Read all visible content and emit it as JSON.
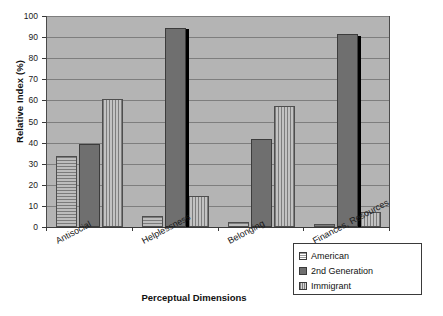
{
  "chart_data": {
    "type": "bar",
    "title": "",
    "xlabel": "Perceptual Dimensions",
    "ylabel": "Relative Index (%)",
    "categories": [
      "Antisocial",
      "Helplessness",
      "Belonging",
      "Finances, Resources"
    ],
    "series": [
      {
        "name": "American",
        "values": [
          33.5,
          5.0,
          2.5,
          1.2
        ]
      },
      {
        "name": "2nd Generation",
        "values": [
          39.5,
          94.5,
          41.5,
          91.5
        ]
      },
      {
        "name": "Immigrant",
        "values": [
          60.5,
          14.5,
          57.5,
          7.3
        ]
      }
    ],
    "ylim": [
      0,
      100
    ],
    "ytick_labels": [
      "100",
      "90",
      "80",
      "70",
      "60",
      "50",
      "40",
      "30",
      "20",
      "10",
      "0"
    ],
    "ytick_values": [
      100,
      90,
      80,
      70,
      60,
      50,
      40,
      30,
      20,
      10,
      0
    ],
    "grid": true,
    "legend_position": "bottom-right",
    "annotations": [
      {
        "name": "helplessness-marker",
        "category": "Helplessness",
        "top_value": 94.0,
        "bottom_value": 0
      },
      {
        "name": "finances-marker",
        "category": "Finances, Resources",
        "top_value": 90.5,
        "bottom_value": 0
      }
    ],
    "colors": {
      "plot_background": "#b4b4b4",
      "gridline": "#7e7e7e",
      "american": "#b9b9b9",
      "second_generation": "#6f6f6f",
      "immigrant": "#bcbcbc",
      "annotation_line": "#000000",
      "axis": "#3a3a3a",
      "text": "#1a1a1a"
    }
  },
  "legend": {
    "items": [
      {
        "label": "American",
        "swatch": "american-swatch-icon"
      },
      {
        "label": "2nd Generation",
        "swatch": "second-generation-swatch-icon"
      },
      {
        "label": "Immigrant",
        "swatch": "immigrant-swatch-icon"
      }
    ]
  }
}
